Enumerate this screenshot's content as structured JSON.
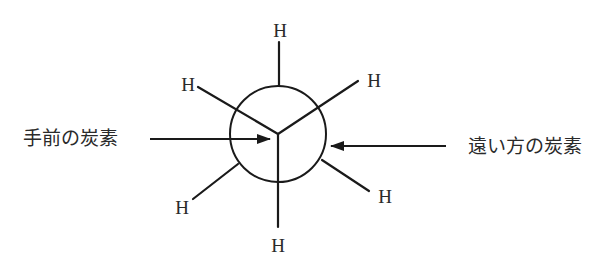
{
  "diagram": {
    "type": "Newman projection",
    "atom_label": "H",
    "front_carbon_label": "手前の炭素",
    "back_carbon_label": "遠い方の炭素",
    "front_substituents": [
      "H",
      "H",
      "H"
    ],
    "back_substituents": [
      "H",
      "H",
      "H"
    ],
    "colors": {
      "stroke": "#1a1a1a",
      "text": "#2a2a2a",
      "background": "#ffffff"
    }
  }
}
